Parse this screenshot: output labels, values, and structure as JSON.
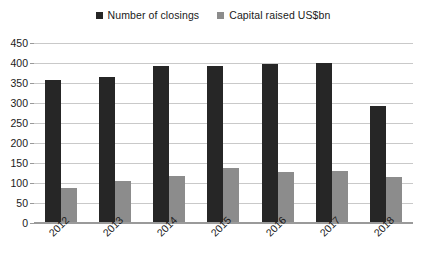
{
  "chart_data": {
    "type": "bar",
    "title": "",
    "subtitle": "",
    "xlabel": "",
    "ylabel": "",
    "categories": [
      "2012",
      "2013",
      "2014",
      "2015",
      "2016",
      "2017",
      "2018"
    ],
    "series": [
      {
        "name": "Number of closings",
        "color": "#262626",
        "values": [
          357,
          365,
          393,
          393,
          398,
          400,
          292
        ]
      },
      {
        "name": "Capital raised US$bn",
        "color": "#8c8c8c",
        "values": [
          88,
          105,
          118,
          138,
          128,
          130,
          115
        ]
      }
    ],
    "ylim": [
      0,
      450
    ],
    "ytick_step": 50,
    "yticks": [
      "450",
      "400",
      "350",
      "300",
      "250",
      "200",
      "150",
      "100",
      "50",
      "0"
    ],
    "grid": true,
    "legend_position": "top-center",
    "gridline_color": "#c9c9c9",
    "axis_color": "#9a9a9a",
    "background": "#ffffff"
  },
  "legend": {
    "items": [
      {
        "label": "Number of closings",
        "color": "#262626"
      },
      {
        "label": "Capital raised US$bn",
        "color": "#8c8c8c"
      }
    ]
  }
}
